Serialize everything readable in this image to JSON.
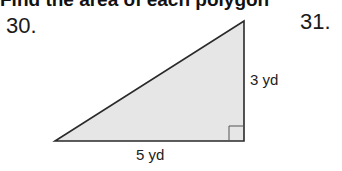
{
  "heading_partial": "Find the area of each polygon",
  "problems": [
    {
      "number": "30.",
      "figure": "right-triangle",
      "height_label": "3 yd",
      "base_label": "5 yd"
    },
    {
      "number": "31."
    }
  ],
  "colors": {
    "fill": "#e6e6e6",
    "stroke": "#2a2a2a"
  }
}
